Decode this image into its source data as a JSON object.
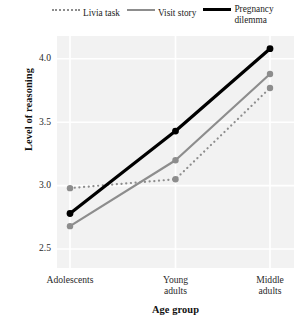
{
  "chart_data": {
    "type": "line",
    "title": "",
    "subtitle": "",
    "xlabel": "Age group",
    "ylabel": "Level of reasoning",
    "categories": [
      "Adolescents",
      "Young adults",
      "Middle adults"
    ],
    "category_labels_multiline": [
      [
        "Adolescents"
      ],
      [
        "Young",
        "adults"
      ],
      [
        "Middle",
        "adults"
      ]
    ],
    "ylim": [
      2.35,
      4.18
    ],
    "yticks": [
      2.5,
      3.0,
      3.5,
      4.0
    ],
    "ytick_labels": [
      "2.5",
      "3.0",
      "3.5",
      "4.0"
    ],
    "grid": true,
    "grid_color": "#ffffff",
    "panel_background": "#f2f2f2",
    "legend_position": "top",
    "markers": "circle",
    "series": [
      {
        "name": "Livia task",
        "values": [
          2.98,
          3.05,
          3.77
        ],
        "style": "dotted",
        "color": "#8d8d8d",
        "width": 2.2
      },
      {
        "name": "Visit story",
        "values": [
          2.68,
          3.2,
          3.88
        ],
        "style": "solid",
        "color": "#8d8d8d",
        "width": 2.2
      },
      {
        "name": "Pregnancy dilemma",
        "values": [
          2.78,
          3.43,
          4.08
        ],
        "style": "solid",
        "color": "#000000",
        "width": 3.2,
        "label_lines": [
          "Pregnancy",
          "dilemma"
        ]
      }
    ]
  },
  "legend": {
    "entries": [
      {
        "label": "Livia task",
        "label_line2": ""
      },
      {
        "label": "Visit story",
        "label_line2": ""
      },
      {
        "label": "Pregnancy dilemma",
        "label_line2": ""
      }
    ],
    "entry_0_label": "Livia task",
    "entry_1_label": "Visit story",
    "entry_2_label": "Pregnancy dilemma"
  },
  "axes": {
    "y_title": "Level of reasoning",
    "x_title": "Age group",
    "y_tick_0": "2.5",
    "y_tick_1": "3.0",
    "y_tick_2": "3.5",
    "y_tick_3": "4.0",
    "x_tick_0": "Adolescents",
    "x_tick_1": "Young adults",
    "x_tick_2": "Middle adults"
  }
}
